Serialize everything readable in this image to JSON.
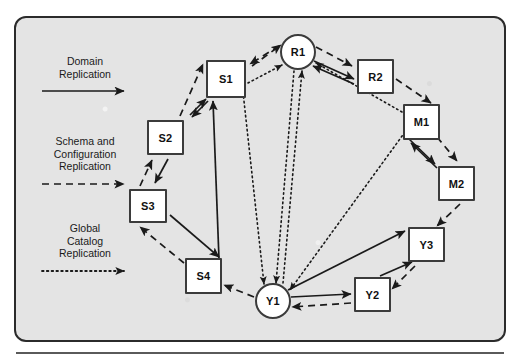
{
  "diagram": {
    "background_color": "#e4e4e4",
    "border_color": "#2b2b2b",
    "node_fill": "#ffffff",
    "line_color": "#1a1a1a"
  },
  "legend": {
    "items": [
      {
        "label": "Domain\nReplication",
        "style": "solid",
        "icon": "solid-arrow-icon",
        "x": 20,
        "y": 55
      },
      {
        "label": "Schema and\nConfiguration\nReplication",
        "style": "dashed",
        "icon": "dashed-arrow-icon",
        "x": 20,
        "y": 135
      },
      {
        "label": "Global\nCatalog\nReplication",
        "style": "dotted",
        "icon": "dotted-arrow-icon",
        "x": 20,
        "y": 222
      }
    ]
  },
  "nodes": [
    {
      "id": "R1",
      "label": "R1",
      "shape": "circle",
      "cx": 298,
      "cy": 52,
      "r": 18
    },
    {
      "id": "R2",
      "label": "R2",
      "shape": "square",
      "x": 357,
      "y": 59,
      "w": 37,
      "h": 35
    },
    {
      "id": "M1",
      "label": "M1",
      "shape": "square",
      "x": 403,
      "y": 104,
      "w": 37,
      "h": 36
    },
    {
      "id": "M2",
      "label": "M2",
      "shape": "square",
      "x": 438,
      "y": 166,
      "w": 37,
      "h": 35
    },
    {
      "id": "Y3",
      "label": "Y3",
      "shape": "square",
      "x": 408,
      "y": 227,
      "w": 37,
      "h": 35
    },
    {
      "id": "Y2",
      "label": "Y2",
      "shape": "square",
      "x": 354,
      "y": 277,
      "w": 37,
      "h": 35
    },
    {
      "id": "Y1",
      "label": "Y1",
      "shape": "circle",
      "cx": 273,
      "cy": 301,
      "r": 18
    },
    {
      "id": "S4",
      "label": "S4",
      "shape": "square",
      "x": 185,
      "y": 258,
      "w": 37,
      "h": 36
    },
    {
      "id": "S3",
      "label": "S3",
      "shape": "square",
      "x": 129,
      "y": 189,
      "w": 38,
      "h": 34
    },
    {
      "id": "S2",
      "label": "S2",
      "shape": "square",
      "x": 147,
      "y": 120,
      "w": 37,
      "h": 35
    },
    {
      "id": "S1",
      "label": "S1",
      "shape": "square",
      "x": 206,
      "y": 60,
      "w": 40,
      "h": 38
    }
  ],
  "edges": {
    "domain_replication": [
      {
        "from": "S1",
        "to": "S2",
        "arrows": "both"
      },
      {
        "from": "S2",
        "to": "S3",
        "arrows": "to"
      },
      {
        "from": "S3",
        "to": "S4",
        "arrows": "to"
      },
      {
        "from": "S4",
        "to": "S1",
        "arrows": "to"
      },
      {
        "from": "R1",
        "to": "R2",
        "arrows": "both"
      },
      {
        "from": "M1",
        "to": "M2",
        "arrows": "both"
      },
      {
        "from": "Y1",
        "to": "Y2",
        "arrows": "to"
      },
      {
        "from": "Y1",
        "to": "Y3",
        "arrows": "to"
      },
      {
        "from": "Y2",
        "to": "Y3",
        "arrows": "to"
      }
    ],
    "schema_configuration_replication": [
      {
        "from": "S1",
        "to": "R1",
        "arrows": "both"
      },
      {
        "from": "R1",
        "to": "R2",
        "arrows": "to"
      },
      {
        "from": "R2",
        "to": "M1",
        "arrows": "to"
      },
      {
        "from": "M1",
        "to": "M2",
        "arrows": "to"
      },
      {
        "from": "M2",
        "to": "Y3",
        "arrows": "to"
      },
      {
        "from": "Y3",
        "to": "Y2",
        "arrows": "to"
      },
      {
        "from": "Y2",
        "to": "Y1",
        "arrows": "to"
      },
      {
        "from": "Y1",
        "to": "S4",
        "arrows": "to"
      },
      {
        "from": "S4",
        "to": "S3",
        "arrows": "to"
      },
      {
        "from": "S3",
        "to": "S2",
        "arrows": "to"
      },
      {
        "from": "S2",
        "to": "S1",
        "arrows": "to"
      }
    ],
    "global_catalog_replication": [
      {
        "from": "R1",
        "to": "Y1",
        "arrows": "both"
      },
      {
        "from": "S1",
        "to": "Y1",
        "arrows": "to"
      },
      {
        "from": "M1",
        "to": "Y1",
        "arrows": "to"
      },
      {
        "from": "S1",
        "to": "R1",
        "arrows": "to"
      },
      {
        "from": "M1",
        "to": "R1",
        "arrows": "to"
      }
    ]
  }
}
